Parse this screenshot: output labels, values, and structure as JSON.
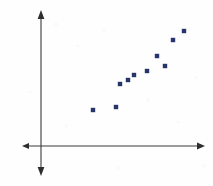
{
  "figure": {
    "width": 213,
    "height": 186,
    "background_color": "#fefefe",
    "axis_color": "#3a3a3a",
    "marker_color": "#27356b",
    "marker_shape": "square",
    "marker_size_px": 4,
    "title": "",
    "has_gridlines": false,
    "has_tick_labels": false,
    "has_axis_labels": false,
    "has_legend": false
  },
  "axes": {
    "vertical": {
      "x_px": 41,
      "y_top_px": 10,
      "y_bottom_px": 176,
      "arrow_top": true,
      "arrow_bottom": true
    },
    "horizontal": {
      "y_px": 146,
      "x_left_px": 22,
      "x_right_px": 205,
      "arrow_left": true,
      "arrow_right": true
    },
    "origin_px": {
      "x": 41,
      "y": 146
    }
  },
  "chart_data": {
    "type": "scatter",
    "title": "",
    "xlabel": "",
    "ylabel": "",
    "xlim": [
      0,
      10
    ],
    "ylim": [
      0,
      10
    ],
    "grid": false,
    "legend": false,
    "trend": "positive linear association",
    "n_points": 10,
    "series": [
      {
        "name": "data",
        "color": "#27356b",
        "points_px": [
          {
            "x": 93,
            "y": 110
          },
          {
            "x": 116,
            "y": 107
          },
          {
            "x": 120,
            "y": 84
          },
          {
            "x": 134,
            "y": 75
          },
          {
            "x": 147,
            "y": 71
          },
          {
            "x": 157,
            "y": 56
          },
          {
            "x": 165,
            "y": 66
          },
          {
            "x": 173,
            "y": 40
          },
          {
            "x": 184,
            "y": 31
          },
          {
            "x": 128,
            "y": 80
          }
        ],
        "x": [
          3.2,
          4.6,
          4.8,
          5.7,
          6.5,
          7.1,
          7.6,
          8.1,
          8.7,
          5.3
        ],
        "y": [
          2.6,
          2.9,
          4.6,
          5.2,
          5.5,
          6.6,
          5.9,
          7.8,
          8.4,
          4.9
        ]
      }
    ]
  },
  "noise_specks": [
    {
      "x": 56,
      "y": 24,
      "r": 1.6
    },
    {
      "x": 78,
      "y": 46,
      "r": 1.3
    },
    {
      "x": 104,
      "y": 30,
      "r": 1.5
    },
    {
      "x": 148,
      "y": 100,
      "r": 1.7
    },
    {
      "x": 196,
      "y": 78,
      "r": 1.4
    },
    {
      "x": 66,
      "y": 126,
      "r": 1.5
    },
    {
      "x": 178,
      "y": 122,
      "r": 1.3
    },
    {
      "x": 118,
      "y": 168,
      "r": 1.4
    },
    {
      "x": 30,
      "y": 92,
      "r": 1.2
    },
    {
      "x": 204,
      "y": 166,
      "r": 1.5
    }
  ]
}
